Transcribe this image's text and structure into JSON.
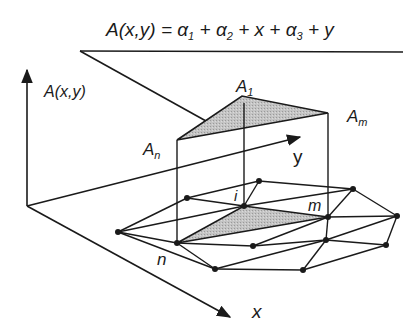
{
  "formula": {
    "lhs": "A(x,y) = ",
    "a1": "α",
    "a1_sub": "1",
    "p1": " + ",
    "a2": "α",
    "a2_sub": "2",
    "p2": " + x + ",
    "a3": "α",
    "a3_sub": "3",
    "p3": " + y"
  },
  "axes": {
    "vertical_label": "A(x,y)",
    "x_label": "x",
    "y_label": "y"
  },
  "vertices": {
    "a1": {
      "letter": "A",
      "sub": "1"
    },
    "am": {
      "letter": "A",
      "sub": "m"
    },
    "an": {
      "letter": "A",
      "sub": "n"
    }
  },
  "nodes": {
    "i": "i",
    "m": "m",
    "n": "n"
  },
  "colors": {
    "line": "#1a1a1a",
    "shade": "#bdbdbd"
  }
}
